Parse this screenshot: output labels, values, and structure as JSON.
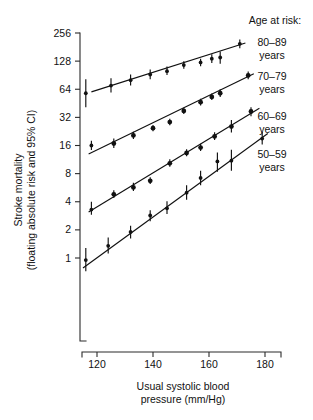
{
  "chart_data": {
    "type": "scatter",
    "title": "",
    "xlabel": "Usual systolic blood pressure (mm/Hg)",
    "ylabel": "Stroke mortality (floating absolute risk and 95% CI)",
    "xlabel_line1": "Usual systolic blood",
    "xlabel_line2": "pressure (mm/Hg)",
    "ylabel_line1": "Stroke mortality",
    "ylabel_line2": "(floating absolute risk and 95% CI)",
    "yscale": "log2",
    "xlim": [
      113,
      183
    ],
    "ylim": [
      0.55,
      300
    ],
    "grid": false,
    "legend_position": "right",
    "legend_title": "Age at risk:",
    "x_ticks": [
      120,
      140,
      160,
      180
    ],
    "x_tick_labels": [
      "120",
      "140",
      "160",
      "180"
    ],
    "y_ticks": [
      1,
      2,
      4,
      8,
      16,
      32,
      64,
      128,
      256
    ],
    "y_tick_labels": [
      "1",
      "2",
      "4",
      "8",
      "16",
      "32",
      "64",
      "128",
      "256"
    ],
    "series": [
      {
        "name": "80-89 years",
        "legend_line1": "80–89",
        "legend_line2": "years",
        "color": "#111111",
        "x": [
          116,
          125,
          132,
          139,
          145,
          151,
          157,
          161,
          164,
          171
        ],
        "y": [
          58,
          70,
          80,
          92,
          100,
          116,
          124,
          136,
          140,
          196
        ],
        "ci_low": [
          41,
          59,
          70,
          82,
          91,
          106,
          113,
          122,
          120,
          176
        ],
        "ci_high": [
          82,
          84,
          92,
          104,
          112,
          128,
          136,
          152,
          162,
          218
        ],
        "fit_x": [
          118,
          173
        ],
        "fit_y": [
          60,
          200
        ]
      },
      {
        "name": "70-79 years",
        "legend_line1": "70–79",
        "legend_line2": "years",
        "color": "#111111",
        "x": [
          118,
          126,
          133,
          140,
          146,
          151,
          157,
          161,
          164,
          174
        ],
        "y": [
          16.0,
          16.8,
          20.5,
          24.5,
          28.5,
          37.5,
          46.5,
          53.0,
          58.0,
          90.0
        ],
        "ci_low": [
          14.3,
          15.0,
          18.8,
          22.8,
          26.4,
          34.8,
          43.0,
          49.0,
          53.0,
          82.0
        ],
        "ci_high": [
          18.0,
          19.0,
          22.5,
          26.5,
          31.0,
          40.5,
          50.5,
          57.5,
          64.0,
          99.0
        ],
        "fit_x": [
          117,
          176
        ],
        "fit_y": [
          13.0,
          94.0
        ]
      },
      {
        "name": "60-69 years",
        "legend_line1": "60–69",
        "legend_line2": "years",
        "color": "#111111",
        "x": [
          118,
          126,
          133,
          139,
          146,
          152,
          157,
          162,
          168,
          175
        ],
        "y": [
          3.3,
          4.8,
          5.7,
          6.7,
          10.3,
          13.3,
          15.2,
          20.0,
          25.5,
          37.0
        ],
        "ci_low": [
          2.9,
          4.4,
          5.2,
          6.2,
          9.5,
          12.3,
          14.0,
          18.3,
          22.0,
          33.0
        ],
        "ci_high": [
          4.0,
          5.3,
          6.4,
          7.3,
          11.4,
          14.6,
          16.7,
          22.2,
          30.0,
          41.0
        ],
        "fit_x": [
          117,
          178
        ],
        "fit_y": [
          3.1,
          40.0
        ]
      },
      {
        "name": "50-59 years",
        "legend_line1": "50–59",
        "legend_line2": "years",
        "color": "#111111",
        "x": [
          116,
          124,
          132,
          139,
          145,
          152,
          157,
          163,
          168,
          179
        ],
        "y": [
          0.95,
          1.35,
          1.9,
          2.85,
          3.4,
          5.0,
          7.2,
          10.8,
          11.0,
          19.0
        ],
        "ci_low": [
          0.72,
          1.12,
          1.62,
          2.48,
          2.95,
          4.2,
          6.0,
          8.4,
          8.6,
          16.4
        ],
        "ci_high": [
          1.28,
          1.66,
          2.22,
          3.25,
          4.05,
          6.0,
          8.6,
          13.5,
          14.4,
          22.5
        ],
        "fit_x": [
          115,
          181
        ],
        "fit_y": [
          0.78,
          21.5
        ]
      }
    ]
  },
  "legend": {
    "title": "Age at risk:",
    "entries": [
      {
        "line1": "80–89",
        "line2": "years"
      },
      {
        "line1": "70–79",
        "line2": "years"
      },
      {
        "line1": "60–69",
        "line2": "years"
      },
      {
        "line1": "50–59",
        "line2": "years"
      }
    ]
  }
}
